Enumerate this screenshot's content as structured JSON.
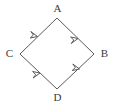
{
  "diagram": {
    "type": "directed-graph",
    "shape": "rhombus",
    "stroke_color": "#5a5a5a",
    "label_color": "#3b3b3b",
    "background_color": "#ffffff",
    "stroke_width": 1,
    "nodes": [
      {
        "id": "A",
        "label": "A",
        "x": 57,
        "y": 18,
        "position": "top"
      },
      {
        "id": "B",
        "label": "B",
        "x": 94,
        "y": 54,
        "position": "right"
      },
      {
        "id": "C",
        "label": "C",
        "x": 20,
        "y": 54,
        "position": "left"
      },
      {
        "id": "D",
        "label": "D",
        "x": 57,
        "y": 89,
        "position": "bottom"
      }
    ],
    "edges": [
      {
        "id": "edge-C-A",
        "from": "C",
        "to": "A",
        "arrow": "up-right",
        "label": ""
      },
      {
        "id": "edge-A-B",
        "from": "A",
        "to": "B",
        "arrow": "down-right",
        "label": ""
      },
      {
        "id": "edge-C-D",
        "from": "C",
        "to": "D",
        "arrow": "down-right",
        "label": ""
      },
      {
        "id": "edge-D-B",
        "from": "D",
        "to": "B",
        "arrow": "up-right",
        "label": ""
      }
    ]
  }
}
